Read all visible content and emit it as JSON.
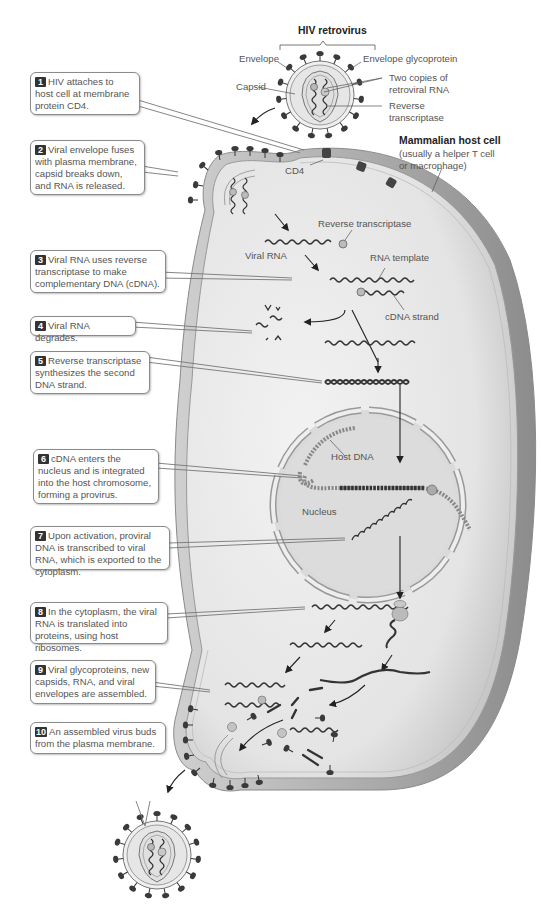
{
  "title": "HIV retrovirus",
  "virus_labels": {
    "envelope": "Envelope",
    "envelope_glycoprotein": "Envelope glycoprotein",
    "capsid": "Capsid",
    "two_copies_line1": "Two copies of",
    "two_copies_line2": "retroviral RNA",
    "reverse_transcriptase_line1": "Reverse",
    "reverse_transcriptase_line2": "transcriptase"
  },
  "host_cell": {
    "title": "Mammalian host cell",
    "subtitle_line1": "(usually a helper T cell",
    "subtitle_line2": "or macrophage)",
    "cd4": "CD4"
  },
  "interior_labels": {
    "reverse_transcriptase": "Reverse transcriptase",
    "viral_rna": "Viral RNA",
    "rna_template": "RNA template",
    "cdna_strand": "cDNA strand",
    "host_dna": "Host DNA",
    "nucleus": "Nucleus"
  },
  "steps": [
    {
      "number": "1",
      "text": "HIV attaches to host cell at membrane protein CD4."
    },
    {
      "number": "2",
      "text": "Viral envelope fuses with plasma membrane, capsid breaks down, and RNA is released."
    },
    {
      "number": "3",
      "text": "Viral RNA uses reverse transcriptase to make complementary DNA (cDNA)."
    },
    {
      "number": "4",
      "text": "Viral RNA degrades."
    },
    {
      "number": "5",
      "text": "Reverse transcriptase synthesizes the second DNA strand."
    },
    {
      "number": "6",
      "text": "cDNA enters the nucleus and is integrated into the host chromosome, forming a provirus."
    },
    {
      "number": "7",
      "text": "Upon activation, proviral DNA is transcribed to viral RNA, which is exported to the cytoplasm."
    },
    {
      "number": "8",
      "text": "In the cytoplasm, the viral RNA is translated into proteins, using host ribosomes."
    },
    {
      "number": "9",
      "text": "Viral glycoproteins, new capsids, RNA, and viral envelopes are assembled."
    },
    {
      "number": "10",
      "text": "An assembled virus buds from the plasma membrane."
    }
  ],
  "colors": {
    "cell_fill": "#e9e9e9",
    "cell_rim": "#9a9a9a",
    "nucleus_fill": "#dcdcdc",
    "dark_strand": "#3a3a3a",
    "host_dna": "#8a8a8a",
    "badge": "#333333"
  }
}
